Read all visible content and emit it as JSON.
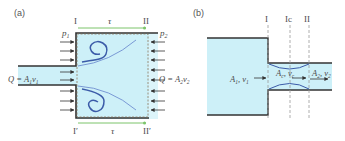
{
  "figure": {
    "panel_a": {
      "label": "(a)",
      "section_top_left": "I",
      "section_top_right": "II",
      "section_bottom_left": "I′",
      "section_bottom_right": "II′",
      "shear_top": "τ",
      "shear_bottom": "τ",
      "pressure_left": "p",
      "pressure_left_sub": "1",
      "pressure_right": "p",
      "pressure_right_sub": "2",
      "inflow_label": "Q = A",
      "inflow_sub": "1",
      "inflow_v": "v",
      "inflow_v_sub": "1",
      "outflow_label": "Q = A",
      "outflow_sub": "2",
      "outflow_v": "v",
      "outflow_v_sub": "2"
    },
    "panel_b": {
      "label": "(b)",
      "section_1": "I",
      "section_c": "Ic",
      "section_2": "II",
      "inlet_label": "A",
      "inlet_sub": "1",
      "inlet_v": ", v",
      "inlet_v_sub": "1",
      "contracta_label": "A",
      "contracta_sub": "c",
      "contracta_v": ", v",
      "contracta_v_sub": "c",
      "outlet_label": "A",
      "outlet_sub": "2",
      "outlet_v": ", v",
      "outlet_v_sub": "2"
    },
    "colors": {
      "fluid": "#cdf0f8",
      "wall": "#333333",
      "vortex": "#3b5ba8",
      "shear": "#7cc46a",
      "dashed": "#9a9a9a"
    }
  }
}
